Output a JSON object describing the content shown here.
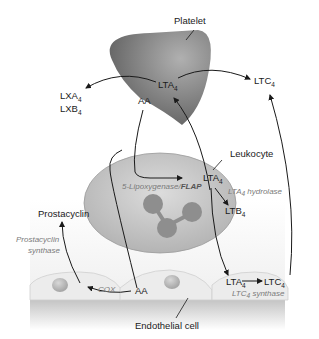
{
  "diagram": {
    "nodes": {
      "platelet": "Platelet",
      "leukocyte": "Leukocyte",
      "endothelial": "Endothelial cell",
      "prostacyclin": "Prostacyclin",
      "lxa": "LXA",
      "lxb": "LXB",
      "ltc_top": "LTC",
      "platelet_lta": "LTA",
      "platelet_aa": "AA",
      "leuk_lta": "LTA",
      "leuk_ltb": "LTB",
      "endo_aa": "AA",
      "endo_lta": "LTA",
      "endo_ltc": "LTC",
      "sub4": "4"
    },
    "enzymes": {
      "lipox": "5-Lipoxygenase/",
      "flap": "FLAP",
      "lta4h_a": "LTA",
      "lta4h_b": "hydrolase",
      "prosta_syn_1": "Prostacyclin",
      "prosta_syn_2": "synthase",
      "cox": "COX",
      "ltc4s_a": "LTC",
      "ltc4s_b": "synthase"
    },
    "colors": {
      "platelet": "#7a7a7a",
      "leukocyte": "#c8c8c8",
      "nucleus": "#8e8e8e",
      "endothelium": "#ececec",
      "arrow": "#1a1a1a"
    }
  }
}
